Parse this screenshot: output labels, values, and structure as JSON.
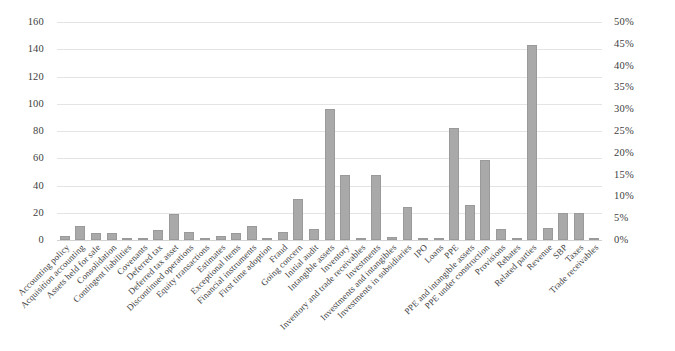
{
  "chart_data": {
    "type": "bar",
    "title": "",
    "xlabel": "",
    "ylabel": "",
    "ylim": [
      0,
      160
    ],
    "yticks": [
      0,
      20,
      40,
      60,
      80,
      100,
      120,
      140,
      160
    ],
    "secondary_axis": {
      "ylim": [
        "0%",
        "50%"
      ],
      "yticks": [
        "0%",
        "5%",
        "10%",
        "15%",
        "20%",
        "25%",
        "30%",
        "35%",
        "40%",
        "45%",
        "50%"
      ],
      "position": "right"
    },
    "grid": true,
    "legend": "none",
    "bar_color": "#a9a9a9",
    "categories": [
      "Accounting policy",
      "Acquisition accounting",
      "Assets held for sale",
      "Consolidation",
      "Contingent liabilities",
      "Covenants",
      "Deferred tax",
      "Deferred tax asset",
      "Discontinued operations",
      "Equity transactions",
      "Estimates",
      "Exceptional items",
      "Financial instruments",
      "First time adoption",
      "Fraud",
      "Going concern",
      "Initial audit",
      "Intangible assets",
      "Inventory",
      "Inventory and trade receivables",
      "Investments",
      "Investments and intangibles",
      "Investments in subsidiaries",
      "IPO",
      "Loans",
      "PPE",
      "PPE and intangible assets",
      "PPE under construction",
      "Provisions",
      "Rebates",
      "Related parties",
      "Revenue",
      "SBP",
      "Taxes",
      "Trade receivables"
    ],
    "values": [
      3,
      10,
      5,
      5,
      1,
      1,
      7,
      19,
      6,
      1,
      3,
      5,
      10,
      1,
      6,
      30,
      8,
      96,
      48,
      1,
      48,
      2,
      24,
      1,
      1,
      82,
      26,
      59,
      8,
      1,
      143,
      9,
      20,
      20,
      1
    ]
  }
}
